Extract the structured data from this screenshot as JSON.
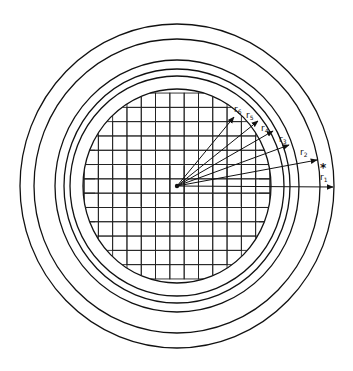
{
  "diagram": {
    "center": {
      "x": 177,
      "y": 186
    },
    "rings": [
      {
        "name": "grid-boundary",
        "rx": 94,
        "ry": 97
      },
      {
        "name": "ring-r6",
        "rx": 107,
        "ry": 110
      },
      {
        "name": "ring-r5",
        "rx": 113,
        "ry": 117
      },
      {
        "name": "ring-r4",
        "rx": 122,
        "ry": 126
      },
      {
        "name": "ring-r2",
        "rx": 143,
        "ry": 147
      },
      {
        "name": "ring-r1",
        "rx": 157,
        "ry": 162
      }
    ],
    "grid": {
      "cell": 14.3,
      "columns": 13,
      "rows": 13
    },
    "radii": [
      {
        "label": "r",
        "sub": "1",
        "tip": [
          333,
          187
        ],
        "label_pos": [
          320,
          180
        ]
      },
      {
        "label": "r",
        "sub": "2",
        "tip": [
          317,
          160
        ],
        "label_pos": [
          300,
          155
        ]
      },
      {
        "label": "r",
        "sub": "3",
        "tip": [
          289,
          145
        ],
        "label_pos": [
          279,
          142
        ]
      },
      {
        "label": "r",
        "sub": "4",
        "tip": [
          273,
          131
        ],
        "label_pos": [
          261,
          131
        ]
      },
      {
        "label": "r",
        "sub": "5",
        "tip": [
          258,
          121
        ],
        "label_pos": [
          246,
          118
        ]
      },
      {
        "label": "r",
        "sub": "6",
        "tip": [
          234,
          117
        ],
        "label_pos": [
          234,
          112
        ]
      }
    ],
    "marker": {
      "symbol": "*",
      "pos": [
        320,
        172
      ]
    }
  }
}
